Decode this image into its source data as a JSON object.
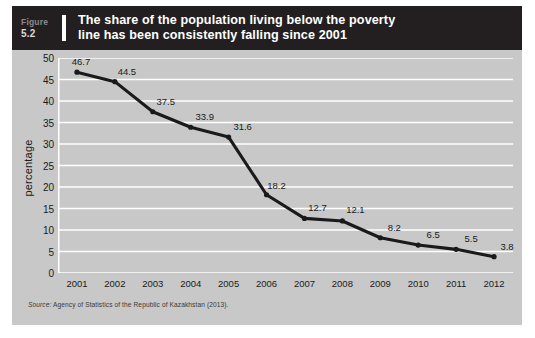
{
  "figure": {
    "label_word": "Figure",
    "number": "5.2",
    "title": "The share of the population living below the poverty\nline has been consistently falling since 2001"
  },
  "source": {
    "lead": "Source:",
    "text": " Agency of Statistics of the Republic of Kazakhstan (2013)."
  },
  "colors": {
    "header_bg": "#231f20",
    "card_bg": "#c8c8c8",
    "gridline": "#ffffff",
    "line": "#1a1a1a",
    "marker": "#1a1a1a",
    "text": "#1a1a1a"
  },
  "chart_data": {
    "type": "line",
    "title": "The share of the population living below the poverty line has been consistently falling since 2001",
    "xlabel": "",
    "ylabel": "percentage",
    "categories": [
      "2001",
      "2002",
      "2003",
      "2004",
      "2005",
      "2006",
      "2007",
      "2008",
      "2009",
      "2010",
      "2011",
      "2012"
    ],
    "values": [
      46.7,
      44.5,
      37.5,
      33.9,
      31.6,
      18.2,
      12.7,
      12.1,
      8.2,
      6.5,
      5.5,
      3.8
    ],
    "point_labels": [
      "46.7",
      "44.5",
      "37.5",
      "33.9",
      "31.6",
      "18.2",
      "12.7",
      "12.1",
      "8.2",
      "6.5",
      "5.5",
      "3.8"
    ],
    "ylim": [
      0,
      50
    ],
    "yticks": [
      0,
      5,
      10,
      15,
      20,
      25,
      30,
      35,
      40,
      45,
      50
    ],
    "ytick_labels": [
      "0",
      "5",
      "10",
      "15",
      "20",
      "25",
      "30",
      "35",
      "40",
      "45",
      "50"
    ],
    "grid": true,
    "grid_axis": "y",
    "legend": false,
    "legend_position": "none",
    "marker": "circle",
    "series_name": "Poverty headcount"
  }
}
